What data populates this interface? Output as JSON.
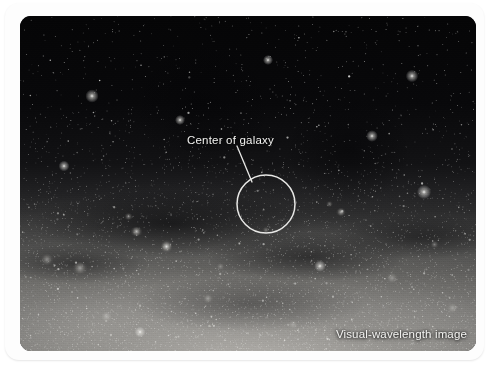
{
  "figure": {
    "type": "astronomical-photograph",
    "background_color": "#ffffff",
    "card_color": "#fdfdfd"
  },
  "annotations": {
    "center_label": "Center of galaxy",
    "caption": "Visual-wavelength image",
    "annotation_color": "#f2f2f0",
    "marker": {
      "shape": "circle",
      "center_x": 246,
      "center_y": 188,
      "radius": 29,
      "stroke_color": "#e8e8e6",
      "stroke_width": 1.5
    },
    "leader_line": {
      "x1": 217,
      "y1": 130,
      "x2": 232,
      "y2": 166,
      "stroke_color": "#e8e8e6",
      "stroke_width": 1.3
    }
  },
  "sky": {
    "width": 456,
    "height": 335,
    "corner_radius": 11,
    "band_description": "Milky Way star clouds brightening toward the lower half",
    "knots": [
      {
        "x": 116,
        "y": 215,
        "w": 13,
        "h": 9,
        "o": 0.7
      },
      {
        "x": 146,
        "y": 230,
        "w": 11,
        "h": 13,
        "o": 0.85
      },
      {
        "x": 108,
        "y": 200,
        "w": 9,
        "h": 7,
        "o": 0.45
      },
      {
        "x": 321,
        "y": 196,
        "w": 10,
        "h": 8,
        "o": 0.62
      },
      {
        "x": 309,
        "y": 188,
        "w": 7,
        "h": 6,
        "o": 0.4
      },
      {
        "x": 60,
        "y": 252,
        "w": 16,
        "h": 12,
        "o": 0.5
      },
      {
        "x": 27,
        "y": 243,
        "w": 14,
        "h": 11,
        "o": 0.42
      },
      {
        "x": 188,
        "y": 282,
        "w": 12,
        "h": 9,
        "o": 0.38
      },
      {
        "x": 246,
        "y": 214,
        "w": 8,
        "h": 6,
        "o": 0.34
      },
      {
        "x": 372,
        "y": 262,
        "w": 14,
        "h": 10,
        "o": 0.33
      },
      {
        "x": 414,
        "y": 228,
        "w": 9,
        "h": 7,
        "o": 0.36
      },
      {
        "x": 432,
        "y": 292,
        "w": 13,
        "h": 10,
        "o": 0.3
      },
      {
        "x": 86,
        "y": 300,
        "w": 15,
        "h": 11,
        "o": 0.32
      },
      {
        "x": 273,
        "y": 308,
        "w": 12,
        "h": 9,
        "o": 0.28
      },
      {
        "x": 200,
        "y": 250,
        "w": 9,
        "h": 7,
        "o": 0.3
      }
    ],
    "bright_stars": [
      {
        "x": 72,
        "y": 80,
        "r": 1.6
      },
      {
        "x": 392,
        "y": 60,
        "r": 1.5
      },
      {
        "x": 352,
        "y": 120,
        "r": 1.4
      },
      {
        "x": 404,
        "y": 176,
        "r": 1.7
      },
      {
        "x": 44,
        "y": 150,
        "r": 1.3
      },
      {
        "x": 248,
        "y": 44,
        "r": 1.2
      },
      {
        "x": 160,
        "y": 104,
        "r": 1.2
      },
      {
        "x": 300,
        "y": 250,
        "r": 1.4
      },
      {
        "x": 120,
        "y": 316,
        "r": 1.3
      }
    ]
  }
}
